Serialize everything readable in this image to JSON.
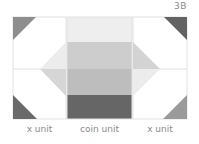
{
  "figure": {
    "label": "3B"
  },
  "units": [
    {
      "caption": "x unit",
      "type": "x-unit",
      "position": "left",
      "corner_triangles": [
        {
          "corner": "top-left",
          "color": "#8e8e8e"
        },
        {
          "corner": "bottom-left",
          "color": "#6a6a6a"
        }
      ],
      "center_triangles": [
        {
          "half": "top",
          "color": "#ececec"
        },
        {
          "half": "bottom",
          "color": "#d6d6d6"
        }
      ]
    },
    {
      "caption": "coin unit",
      "type": "coin-unit",
      "position": "center",
      "stripes": [
        {
          "color": "#eeeeee"
        },
        {
          "color": "#cdcdcd"
        },
        {
          "color": "#bdbdbd"
        },
        {
          "color": "#666666"
        }
      ]
    },
    {
      "caption": "x unit",
      "type": "x-unit",
      "position": "right",
      "corner_triangles": [
        {
          "corner": "top-right",
          "color": "#636363"
        },
        {
          "corner": "bottom-right",
          "color": "#9a9a9a"
        }
      ],
      "center_triangles": [
        {
          "half": "top",
          "color": "#d3d3d3"
        },
        {
          "half": "bottom",
          "color": "#ececec"
        }
      ]
    }
  ],
  "colors": {
    "border": "#e2e2e2",
    "caption_text": "#8a8a8a",
    "background": "#ffffff"
  }
}
